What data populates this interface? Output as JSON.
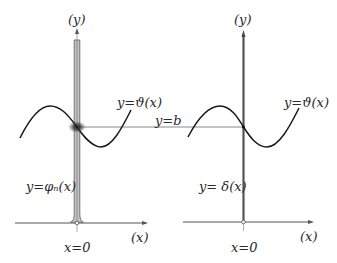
{
  "colors": {
    "axis": "#444444",
    "curve": "#1a1a1a",
    "bar_fill": "#bdbdbd",
    "bar_edge": "#6a6a6a",
    "guide_line": "#888888",
    "blur_spot": "#333333",
    "text": "#2a2a2a"
  },
  "left_panel": {
    "y_axis_label": "(y)",
    "x_axis_label": "(x)",
    "origin_label": "x=0",
    "curve_label": "y=ϑ(x)",
    "spike_label": "y=φₙ(x)"
  },
  "right_panel": {
    "y_axis_label": "(y)",
    "x_axis_label": "(x)",
    "origin_label": "x=0",
    "curve_label": "y=ϑ(x)",
    "spike_label": "y= δ(x)"
  },
  "connector": {
    "label": "y=b"
  }
}
